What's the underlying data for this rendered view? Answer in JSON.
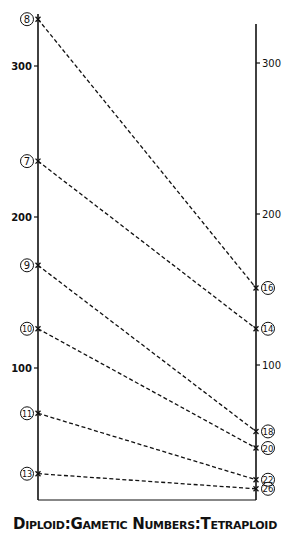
{
  "chart_data": {
    "type": "line",
    "title": "",
    "xlabel": "Diploid : Gametic Numbers : Tetraploid",
    "caption": "Diploid:Gametic Numbers:Tetraploid",
    "x": [
      "Diploid",
      "Tetraploid"
    ],
    "left_axis": {
      "label": "Diploid",
      "ticks": [
        100,
        200,
        300
      ],
      "range": [
        0,
        345
      ]
    },
    "right_axis": {
      "label": "Tetraploid",
      "ticks": [
        100,
        200,
        300
      ],
      "range": [
        0,
        345
      ]
    },
    "grid": false,
    "legend": "none",
    "line_style": "dashed",
    "series": [
      {
        "name": "8 → 16",
        "diploid_label": "8",
        "tetraploid_label": "16",
        "values": [
          331,
          153
        ]
      },
      {
        "name": "7 → 14",
        "diploid_label": "7",
        "tetraploid_label": "14",
        "values": [
          237,
          126
        ]
      },
      {
        "name": "9 → 18",
        "diploid_label": "9",
        "tetraploid_label": "18",
        "values": [
          168,
          58
        ]
      },
      {
        "name": "10 → 20",
        "diploid_label": "10",
        "tetraploid_label": "20",
        "values": [
          126,
          47
        ]
      },
      {
        "name": "11 → 22",
        "diploid_label": "11",
        "tetraploid_label": "22",
        "values": [
          70,
          26
        ]
      },
      {
        "name": "13 → 26",
        "diploid_label": "13",
        "tetraploid_label": "26",
        "values": [
          30,
          20
        ]
      }
    ]
  },
  "caption": {
    "part1": "Diploid",
    "sep1": ":",
    "part2": "Gametic Numbers",
    "sep2": ":",
    "part3": "Tetraploid"
  },
  "colors": {
    "ink": "#111111",
    "background": "#ffffff"
  }
}
